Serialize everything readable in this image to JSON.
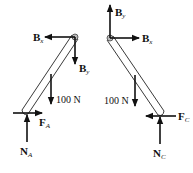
{
  "diagram": {
    "type": "free-body diagram",
    "left_member": {
      "forces": [
        {
          "name": "B",
          "sub": "x",
          "direction": "left"
        },
        {
          "name": "B",
          "sub": "y",
          "direction": "down"
        },
        {
          "name": "100 N",
          "sub": "",
          "direction": "down"
        },
        {
          "name": "F",
          "sub": "A",
          "direction": "right"
        },
        {
          "name": "N",
          "sub": "A",
          "direction": "up"
        }
      ]
    },
    "right_member": {
      "forces": [
        {
          "name": "B",
          "sub": "y",
          "direction": "up"
        },
        {
          "name": "B",
          "sub": "x",
          "direction": "right"
        },
        {
          "name": "100 N",
          "sub": "",
          "direction": "down"
        },
        {
          "name": "F",
          "sub": "C",
          "direction": "left"
        },
        {
          "name": "N",
          "sub": "C",
          "direction": "up"
        }
      ]
    }
  }
}
